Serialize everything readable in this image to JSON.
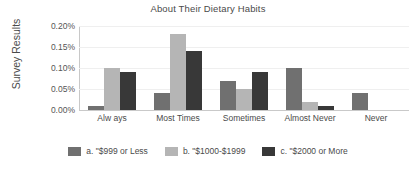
{
  "chart_data": {
    "type": "bar",
    "title": "About Their Dietary Habits",
    "xlabel": "",
    "ylabel": "Survey Results",
    "categories": [
      "Alw ays",
      "Most Times",
      "Sometimes",
      "Almost Never",
      "Never"
    ],
    "series": [
      {
        "name": "a. \"$999 or Less",
        "color": "#707070",
        "values": [
          0.01,
          0.04,
          0.07,
          0.1,
          0.04
        ]
      },
      {
        "name": "b. \"$1000-$1999",
        "color": "#b5b5b5",
        "values": [
          0.1,
          0.18,
          0.05,
          0.02,
          null
        ]
      },
      {
        "name": "c. \"$2000 or More",
        "color": "#383838",
        "values": [
          0.09,
          0.14,
          0.09,
          0.01,
          null
        ]
      }
    ],
    "ylim": [
      0.0,
      0.2
    ],
    "ytick_values": [
      0.0,
      0.05,
      0.1,
      0.15,
      0.2
    ],
    "ytick_labels": [
      "0.00%",
      "0.05%",
      "0.10%",
      "0.15%",
      "0.20%"
    ],
    "value_suffix": "%",
    "grid": true,
    "legend_position": "bottom"
  }
}
